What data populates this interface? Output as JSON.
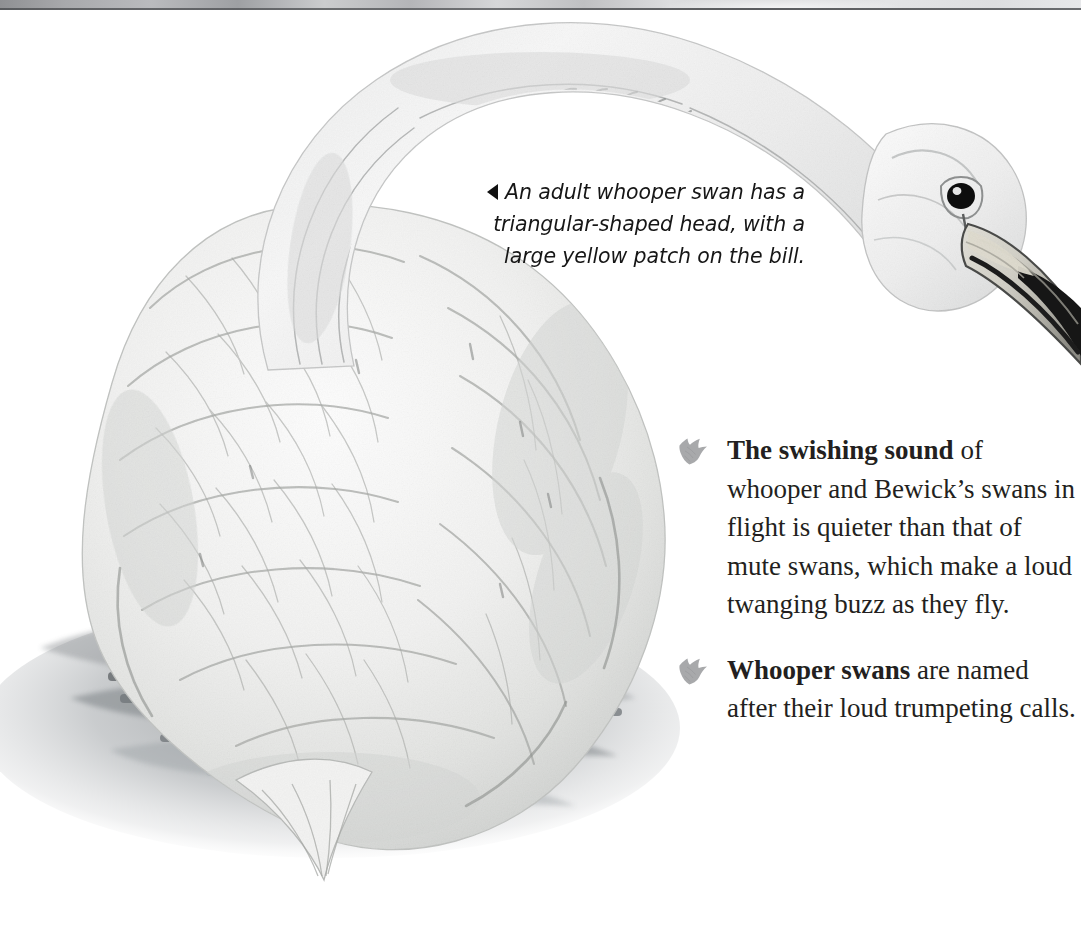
{
  "page": {
    "width": 1081,
    "height": 948,
    "background": "#ffffff"
  },
  "top_strip": {
    "name": "previous-page-sliver",
    "height_px": 10,
    "rule_color": "#4f5154"
  },
  "illustration": {
    "name": "whooper-swan-watercolor",
    "description": "Watercolor illustration of a whooper swan on water, head lowered with long arched neck reaching to the right",
    "colors": {
      "plumage_light": "#f4f4f3",
      "plumage_shadow": "#c9cac8",
      "feather_line": "#9a9c99",
      "bill_pale": "#d9d7cf",
      "bill_tip": "#1a1a1a",
      "eye": "#111111",
      "water_dark": "#6e7174",
      "water_mid": "#9fa3a6",
      "water_light": "#cdd0d2"
    }
  },
  "caption": {
    "name": "swan-head-caption",
    "arrow": "left-triangle",
    "lines": [
      "An adult whooper swan",
      "has a triangular-shaped head,",
      "with a large yellow patch",
      "on the bill."
    ],
    "text": "An adult whooper swan has a triangular-shaped head, with a large yellow patch on the bill."
  },
  "facts": {
    "bullet_icon": "feather-bullet-icon",
    "bullet_color": "#a8a9ab",
    "items": [
      {
        "lead": "The swishing sound",
        "rest": " of whooper and Bewick’s swans in flight is quieter than that of mute swans, which make a loud twanging buzz as they fly.",
        "lines": [
          "The swishing sound",
          "of whooper and",
          "Bewick’s swans in",
          "flight is quieter than",
          "that of mute swans,",
          "which make a loud",
          "twanging buzz as",
          "they fly."
        ]
      },
      {
        "lead": "Whooper swans",
        "rest": " are named after their loud trumpeting calls.",
        "lines": [
          "Whooper swans are",
          "named after their",
          "loud trumpeting",
          "calls."
        ]
      }
    ]
  }
}
